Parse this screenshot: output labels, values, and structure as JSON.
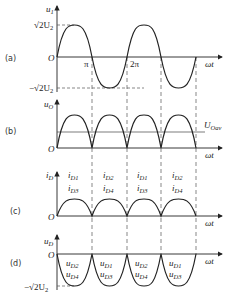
{
  "panels": [
    {
      "id": "a",
      "label": "(a)",
      "ylabel": "u",
      "ylabel_sub": "1",
      "peak_label": "√2U",
      "peak_sub": "2",
      "trough_label": "−√2U",
      "trough_sub": "2",
      "xlabel": "ωt",
      "origin": "O",
      "ticks": [
        "π",
        "2π"
      ]
    },
    {
      "id": "b",
      "label": "(b)",
      "ylabel": "u",
      "ylabel_sub": "O",
      "avg_label": "U",
      "avg_sub": "Oav",
      "xlabel": "ωt",
      "origin": "O"
    },
    {
      "id": "c",
      "label": "(c)",
      "ylabel": "i",
      "ylabel_sub": "D",
      "xlabel": "ωt",
      "origin": "O",
      "segments": [
        {
          "top": "i",
          "top_sub": "D1",
          "bottom": "i",
          "bottom_sub": "D3"
        },
        {
          "top": "i",
          "top_sub": "D2",
          "bottom": "i",
          "bottom_sub": "D4"
        },
        {
          "top": "i",
          "top_sub": "D1",
          "bottom": "i",
          "bottom_sub": "D3"
        },
        {
          "top": "i",
          "top_sub": "D2",
          "bottom": "i",
          "bottom_sub": "D4"
        }
      ]
    },
    {
      "id": "d",
      "label": "(d)",
      "ylabel": "u",
      "ylabel_sub": "D",
      "xlabel": "ωt",
      "origin": "O",
      "trough_label": "−√2U",
      "trough_sub": "2",
      "segments": [
        {
          "top": "u",
          "top_sub": "D2",
          "bottom": "u",
          "bottom_sub": "D4"
        },
        {
          "top": "u",
          "top_sub": "D1",
          "bottom": "u",
          "bottom_sub": "D3"
        },
        {
          "top": "u",
          "top_sub": "D2",
          "bottom": "u",
          "bottom_sub": "D4"
        },
        {
          "top": "u",
          "top_sub": "D1",
          "bottom": "u",
          "bottom_sub": "D3"
        }
      ]
    }
  ],
  "colors": {
    "line": "#222222",
    "dash": "#555555",
    "background": "#ffffff"
  }
}
